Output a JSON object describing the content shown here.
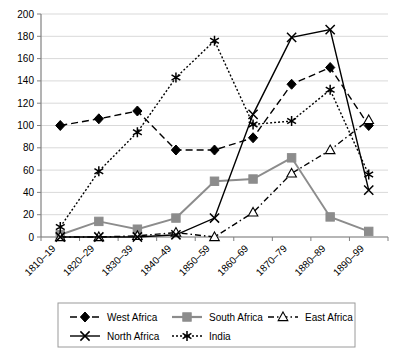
{
  "chart_data": {
    "type": "line",
    "title": "",
    "xlabel": "",
    "ylabel": "",
    "ylim": [
      0,
      200
    ],
    "ytick_step": 20,
    "yticks": [
      0,
      20,
      40,
      60,
      80,
      100,
      120,
      140,
      160,
      180,
      200
    ],
    "grid": true,
    "legend_position": "bottom",
    "categories": [
      "1810–19",
      "1820–29",
      "1830–39",
      "1840–49",
      "1850–59",
      "1860–69",
      "1870–79",
      "1880–89",
      "1890–99"
    ],
    "series": [
      {
        "name": "West Africa",
        "marker": "filled-diamond",
        "line_style": "dashed",
        "color": "#000000",
        "values": [
          100,
          106,
          113,
          78,
          78,
          89,
          137,
          152,
          100
        ]
      },
      {
        "name": "South Africa",
        "marker": "filled-square",
        "line_style": "solid",
        "color": "#8c8c8c",
        "values": [
          2,
          14,
          7,
          17,
          50,
          52,
          71,
          18,
          5
        ]
      },
      {
        "name": "East Africa",
        "marker": "open-triangle",
        "line_style": "dash-dot",
        "color": "#000000",
        "values": [
          0,
          0,
          1,
          4,
          0,
          22,
          57,
          78,
          105
        ]
      },
      {
        "name": "North Africa",
        "marker": "cross-x",
        "line_style": "solid",
        "color": "#000000",
        "values": [
          0,
          0,
          0,
          2,
          17,
          110,
          179,
          186,
          42
        ]
      },
      {
        "name": "India",
        "marker": "asterisk",
        "line_style": "dotted",
        "color": "#000000",
        "values": [
          9,
          59,
          94,
          143,
          176,
          101,
          104,
          132,
          56
        ]
      }
    ]
  },
  "legend": {
    "entries": [
      {
        "label": "West Africa"
      },
      {
        "label": "South Africa"
      },
      {
        "label": "East Africa"
      },
      {
        "label": "North Africa"
      },
      {
        "label": "India"
      }
    ]
  },
  "colors": {
    "grid": "#d9d9d9",
    "axis": "#808080",
    "series_black": "#000000",
    "series_gray": "#8c8c8c",
    "legend_border": "#9a9a9a",
    "background": "#ffffff"
  }
}
